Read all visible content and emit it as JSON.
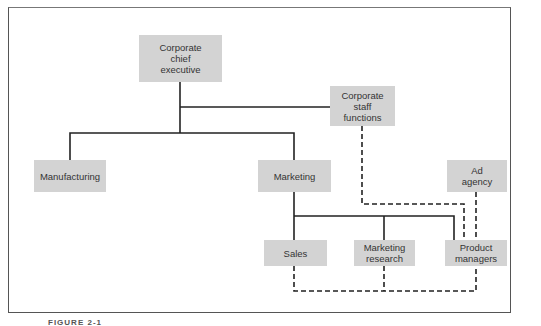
{
  "diagram": {
    "nodes": {
      "exec": "Corporate\nchief\nexecutive",
      "staff": "Corporate\nstaff\nfunctions",
      "manufacturing": "Manufacturing",
      "marketing": "Marketing",
      "ad_agency": "Ad\nagency",
      "sales": "Sales",
      "research": "Marketing\nresearch",
      "product_managers": "Product\nmanagers"
    },
    "edges": {
      "solid": [
        [
          "Corporate chief executive",
          "Corporate staff functions"
        ],
        [
          "Corporate chief executive",
          "Manufacturing"
        ],
        [
          "Corporate chief executive",
          "Marketing"
        ],
        [
          "Marketing",
          "Sales"
        ],
        [
          "Marketing",
          "Marketing research"
        ],
        [
          "Marketing",
          "Product managers"
        ]
      ],
      "dashed": [
        [
          "Corporate staff functions",
          "Product managers"
        ],
        [
          "Ad agency",
          "Product managers"
        ],
        [
          "Product managers",
          "Sales"
        ],
        [
          "Product managers",
          "Marketing research"
        ]
      ]
    },
    "caption": "FIGURE 2-1",
    "colors": {
      "box": "#d3d3d3",
      "line": "#222222",
      "frame": "#555555"
    }
  }
}
